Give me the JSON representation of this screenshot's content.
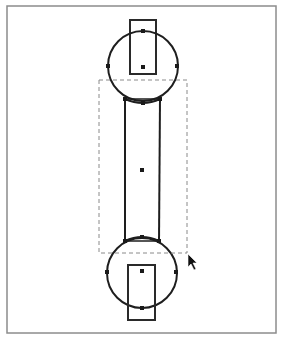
{
  "canvas": {
    "width": 281,
    "height": 339,
    "background": "#ffffff",
    "frame": {
      "x": 7,
      "y": 6,
      "width": 269,
      "height": 327,
      "stroke": "#8c8c8c"
    }
  },
  "shapes": {
    "top_circle": {
      "cx": 143,
      "cy": 66,
      "r": 35
    },
    "top_rect": {
      "x": 130,
      "y": 20,
      "width": 26,
      "height": 54
    },
    "top_rect_center_handle": {
      "x": 143,
      "y": 67
    },
    "tube": {
      "x": 125,
      "y": 100,
      "width": 35,
      "height": 140
    },
    "tube_center_handle": {
      "x": 142,
      "y": 170
    },
    "bottom_circle": {
      "cx": 142,
      "cy": 273,
      "r": 35
    },
    "bottom_rect": {
      "x": 128,
      "y": 265,
      "width": 27,
      "height": 55
    },
    "bottom_rect_center_handle": {
      "x": 142,
      "y": 271
    }
  },
  "selection_box": {
    "x": 99,
    "y": 80,
    "width": 88,
    "height": 173,
    "style": "dashed"
  },
  "handles": [
    {
      "x": 143,
      "y": 31
    },
    {
      "x": 108,
      "y": 66
    },
    {
      "x": 177,
      "y": 66
    },
    {
      "x": 143,
      "y": 103
    },
    {
      "x": 125,
      "y": 99
    },
    {
      "x": 160,
      "y": 99
    },
    {
      "x": 142,
      "y": 237
    },
    {
      "x": 125,
      "y": 241
    },
    {
      "x": 159,
      "y": 241
    },
    {
      "x": 107,
      "y": 272
    },
    {
      "x": 176,
      "y": 272
    },
    {
      "x": 142,
      "y": 308
    }
  ],
  "cursor": {
    "type": "arrow-pointer",
    "x": 188,
    "y": 254
  },
  "colors": {
    "stroke": "#1e1e1e",
    "selection": "#8a8a8a",
    "frame": "#8c8c8c"
  }
}
